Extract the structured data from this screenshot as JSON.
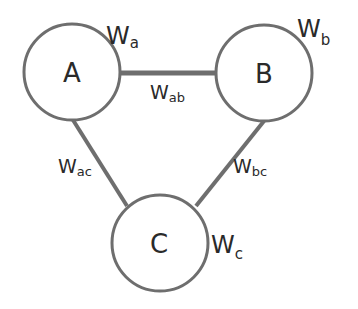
{
  "diagram": {
    "type": "weighted-graph",
    "colors": {
      "stroke": "#6e6e6e",
      "text": "#2a2a2a",
      "background": "#ffffff"
    },
    "nodes": [
      {
        "id": "A",
        "label": "A",
        "weight": {
          "main": "W",
          "sub": "a"
        }
      },
      {
        "id": "B",
        "label": "B",
        "weight": {
          "main": "W",
          "sub": "b"
        }
      },
      {
        "id": "C",
        "label": "C",
        "weight": {
          "main": "W",
          "sub": "c"
        }
      }
    ],
    "edges": [
      {
        "from": "A",
        "to": "B",
        "weight": {
          "main": "W",
          "sub": "ab"
        }
      },
      {
        "from": "A",
        "to": "C",
        "weight": {
          "main": "W",
          "sub": "ac"
        }
      },
      {
        "from": "B",
        "to": "C",
        "weight": {
          "main": "W",
          "sub": "bc"
        }
      }
    ]
  }
}
